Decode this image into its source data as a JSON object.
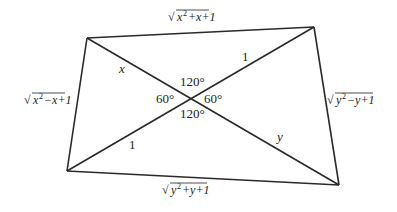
{
  "diagram": {
    "type": "quadrilateral-with-diagonals",
    "line_color": "#2a2a2a",
    "vertices": {
      "top_left": [
        87,
        38
      ],
      "top_right": [
        314,
        27
      ],
      "bottom_right": [
        339,
        185
      ],
      "bottom_left": [
        67,
        171
      ]
    },
    "intersection": [
      195,
      98
    ],
    "sides": {
      "top": {
        "radicand_base": "x",
        "radicand_rest": "+x+1",
        "exponent": "2",
        "full": "√(x²+x+1)"
      },
      "left": {
        "radicand_base": "x",
        "radicand_rest": "−x+1",
        "exponent": "2",
        "full": "√(x²−x+1)"
      },
      "right": {
        "radicand_base": "y",
        "radicand_rest": "−y+1",
        "exponent": "2",
        "full": "√(y²−y+1)"
      },
      "bottom": {
        "radicand_base": "y",
        "radicand_rest": "+y+1",
        "exponent": "2",
        "full": "√(y²+y+1)"
      }
    },
    "segments": {
      "upper_left": "x",
      "upper_right": "1",
      "lower_left": "1",
      "lower_right": "y"
    },
    "angles": {
      "top": "120°",
      "bottom": "120°",
      "left": "60°",
      "right": "60°"
    },
    "sqrt_symbol": "√"
  }
}
